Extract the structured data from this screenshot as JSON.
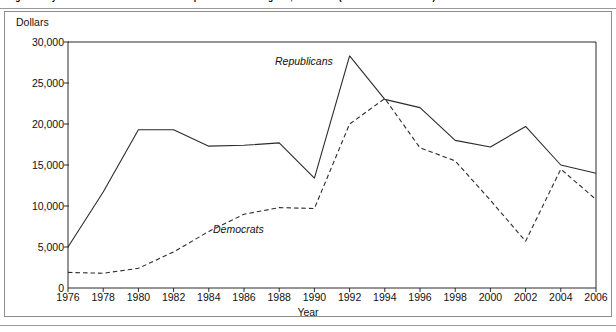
{
  "figure": {
    "caption": "Figure  Party Contributions and Coordinated Expenditures for Congress, 1976–2006 (in thousands of dollars)"
  },
  "axes": {
    "ylabel": "Dollars",
    "xlabel": "Year",
    "yticks": [
      "0",
      "5,000",
      "10,000",
      "15,000",
      "20,000",
      "25,000",
      "30,000"
    ],
    "xticks": [
      "1976",
      "1978",
      "1980",
      "1982",
      "1984",
      "1986",
      "1988",
      "1990",
      "1992",
      "1994",
      "1996",
      "1998",
      "2000",
      "2002",
      "2004",
      "2006"
    ]
  },
  "series_labels": {
    "republicans": "Republicans",
    "democrats": "Democrats"
  },
  "colors": {
    "line": "#2b2b2b",
    "frame": "#8d8d8d",
    "text": "#111111"
  },
  "chart_data": {
    "type": "line",
    "title": "Party Contributions and Coordinated Expenditures for Congress, 1976–2006 (in thousands of dollars)",
    "xlabel": "Year",
    "ylabel": "Dollars",
    "xlim": [
      1976,
      2006
    ],
    "ylim": [
      0,
      30000
    ],
    "ytick_step": 5000,
    "grid": false,
    "legend": "inline-annotation",
    "x": [
      1976,
      1978,
      1980,
      1982,
      1984,
      1986,
      1988,
      1990,
      1992,
      1994,
      1996,
      1998,
      2000,
      2002,
      2004,
      2006
    ],
    "series": [
      {
        "name": "Republicans",
        "style": "solid",
        "values": [
          5000,
          11700,
          19300,
          19300,
          17300,
          17400,
          17700,
          13400,
          28300,
          23000,
          22000,
          18000,
          17200,
          19700,
          15000,
          14000
        ]
      },
      {
        "name": "Democrats",
        "style": "dashed",
        "values": [
          1900,
          1800,
          2400,
          4400,
          6900,
          9000,
          9800,
          9700,
          20000,
          23100,
          17100,
          15500,
          10700,
          5700,
          14500,
          10800
        ]
      }
    ]
  }
}
